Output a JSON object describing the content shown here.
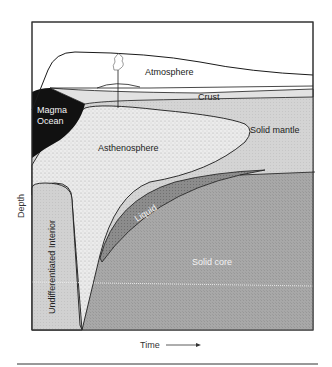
{
  "diagram": {
    "type": "earth-differentiation-cross-section",
    "axes": {
      "x_label": "Time",
      "y_label": "Depth",
      "x_arrow": "right-arrow"
    },
    "regions": {
      "atmosphere": "Atmosphere",
      "crust": "Crust",
      "magma_ocean_line1": "Magma",
      "magma_ocean_line2": "Ocean",
      "asthenosphere": "Asthenosphere",
      "solid_mantle": "Solid mantle",
      "liquid": "Liquid",
      "solid_core": "Solid core",
      "undifferentiated_interior": "Undifferentiated Interior"
    },
    "colors": {
      "magma_ocean": "#111111",
      "asthenosphere": "#e6e6e6",
      "solid_mantle": "#d2d2d2",
      "undifferentiated": "#d0d0d0",
      "liquid": "#8a8a8a",
      "solid_core": "#a5a5a5",
      "outline": "#1a1a1a"
    },
    "icons": [
      "volcano-plume-icon"
    ]
  }
}
